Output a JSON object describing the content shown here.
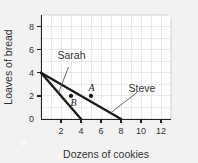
{
  "chart_data": {
    "type": "line",
    "title": "",
    "subtitle": "",
    "xlabel": "Dozens of cookies",
    "ylabel": "Loaves of bread",
    "xlim": [
      0,
      13
    ],
    "ylim": [
      0,
      9
    ],
    "xticks": [
      2,
      4,
      6,
      8,
      10,
      12
    ],
    "yticks": [
      0,
      2,
      4,
      6,
      8
    ],
    "xtick_labels": [
      "2",
      "4",
      "6",
      "8",
      "10",
      "12"
    ],
    "ytick_labels": [
      "0",
      "2",
      "4",
      "6",
      "8"
    ],
    "grid": true,
    "grid_color": "#d8d8d8",
    "legend_position": "inline-annotations",
    "series": [
      {
        "name": "Sarah",
        "type": "line",
        "x": [
          0,
          4
        ],
        "y": [
          4,
          0
        ],
        "color": "#1a1a1a",
        "description": "Sarah production possibilities frontier from (0,4) to (4,0)"
      },
      {
        "name": "Steve",
        "type": "line",
        "x": [
          0,
          8
        ],
        "y": [
          4,
          0
        ],
        "color": "#1a1a1a",
        "description": "Steve production possibilities frontier from (0,4) to (8,0)"
      }
    ],
    "points": [
      {
        "label": "A",
        "x": 5,
        "y": 2,
        "color": "#1a1a1a"
      },
      {
        "label": "B",
        "x": 3,
        "y": 2,
        "color": "#1a1a1a"
      }
    ],
    "annotations": [
      {
        "text": "Sarah",
        "text_x": 3.05,
        "text_y": 5.15,
        "leader_from_x": 2.75,
        "leader_from_y": 4.5,
        "leader_to_x": 1.75,
        "leader_to_y": 2.25
      },
      {
        "text": "Steve",
        "text_x": 10.1,
        "text_y": 2.35,
        "leader_from_x": 9.6,
        "leader_from_y": 2.3,
        "leader_to_x": 7.0,
        "leader_to_y": 0.55
      }
    ]
  },
  "figure": {
    "background_color": "#f2f2f2",
    "plot_background_color": "#ffffff",
    "axis_color": "#222222",
    "text_color": "#333333"
  }
}
